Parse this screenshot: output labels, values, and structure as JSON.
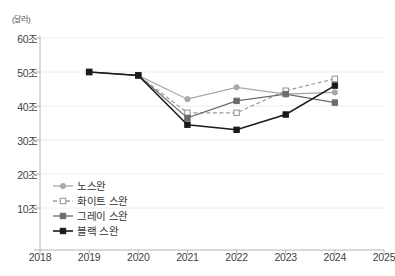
{
  "chart_data": {
    "type": "line",
    "title": "",
    "subtitle": "",
    "xlabel": "",
    "ylabel": "",
    "unit_label": "(달러)",
    "x": [
      2018,
      2019,
      2020,
      2021,
      2022,
      2023,
      2024,
      2025
    ],
    "x_tick_labels": [
      "2018",
      "2019",
      "2020",
      "2021",
      "2022",
      "2023",
      "2024",
      "2025"
    ],
    "xlim": [
      2018,
      2025
    ],
    "ylim": [
      0,
      60
    ],
    "y_ticks": [
      10,
      20,
      30,
      40,
      50,
      60
    ],
    "y_tick_labels": [
      "10조",
      "20조",
      "30조",
      "40조",
      "50조",
      "60조"
    ],
    "grid": true,
    "grid_axis": "y",
    "legend_position": "inside-lower-left",
    "series": [
      {
        "name": "노스완",
        "color": "#a8a8a8",
        "marker": "circle-filled",
        "dash": "solid",
        "x": [
          2019,
          2020,
          2021,
          2022,
          2023,
          2024
        ],
        "values": [
          50.0,
          49.0,
          42.0,
          45.5,
          43.5,
          44.0
        ]
      },
      {
        "name": "화이트 스완",
        "color": "#9a9a9a",
        "marker": "square-hollow",
        "dash": "dashed",
        "x": [
          2019,
          2020,
          2021,
          2022,
          2023,
          2024
        ],
        "values": [
          50.0,
          49.0,
          38.0,
          38.0,
          44.5,
          48.0
        ]
      },
      {
        "name": "그레이 스완",
        "color": "#6b6b6b",
        "marker": "square-filled",
        "dash": "solid",
        "x": [
          2019,
          2020,
          2021,
          2022,
          2023,
          2024
        ],
        "values": [
          50.0,
          49.0,
          36.5,
          41.5,
          43.5,
          41.0
        ]
      },
      {
        "name": "블랙 스완",
        "color": "#1a1a1a",
        "marker": "square-filled",
        "dash": "solid",
        "x": [
          2019,
          2020,
          2021,
          2022,
          2023,
          2024
        ],
        "values": [
          50.0,
          49.0,
          34.5,
          33.0,
          37.5,
          46.0
        ]
      }
    ]
  },
  "legend": {
    "items": [
      {
        "label": "노스완"
      },
      {
        "label": "화이트 스완"
      },
      {
        "label": "그레이 스완"
      },
      {
        "label": "블랙 스완"
      }
    ]
  },
  "colors": {
    "axis": "#b4b4b4",
    "grid": "#ececec",
    "text": "#3f3f3f",
    "background": "#ffffff"
  }
}
